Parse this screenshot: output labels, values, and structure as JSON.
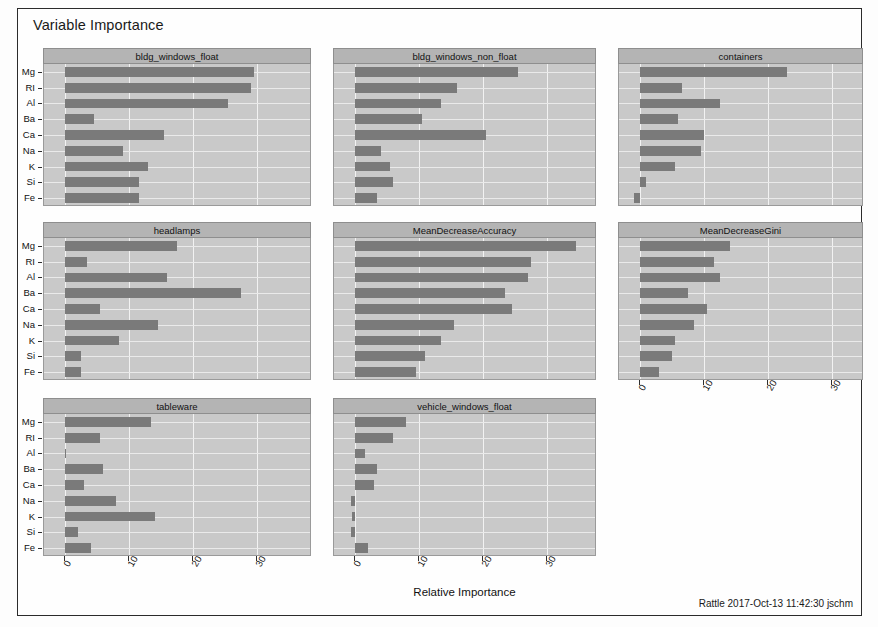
{
  "window": {
    "title": "Variable Importance"
  },
  "footer": {
    "stamp": "Rattle 2017-Oct-13 11:42:30 jschm"
  },
  "chart_data": {
    "type": "bar",
    "title": "Variable Importance",
    "orientation": "horizontal",
    "xlabel": "Relative Importance",
    "ylabel": "",
    "grid": true,
    "legend": false,
    "xlim": [
      -2,
      38
    ],
    "xticks": [
      0,
      10,
      20,
      30
    ],
    "xtick_labels": [
      "0",
      "10",
      "20",
      "30"
    ],
    "categories": [
      "Mg",
      "RI",
      "Al",
      "Ba",
      "Ca",
      "Na",
      "K",
      "Si",
      "Fe"
    ],
    "facet_layout": {
      "rows": 3,
      "cols": 3
    },
    "panels": [
      {
        "name": "bldg_windows_float",
        "values": [
          29.5,
          29.0,
          25.5,
          4.5,
          15.5,
          9.0,
          13.0,
          11.5,
          11.5
        ]
      },
      {
        "name": "bldg_windows_non_float",
        "values": [
          25.5,
          16.0,
          13.5,
          10.5,
          20.5,
          4.0,
          5.5,
          6.0,
          3.5
        ]
      },
      {
        "name": "containers",
        "values": [
          23.0,
          6.5,
          12.5,
          6.0,
          10.0,
          9.5,
          5.5,
          1.0,
          -0.9
        ]
      },
      {
        "name": "headlamps",
        "values": [
          17.5,
          3.5,
          16.0,
          27.5,
          5.5,
          14.5,
          8.5,
          2.5,
          2.5
        ]
      },
      {
        "name": "MeanDecreaseAccuracy",
        "values": [
          34.5,
          27.5,
          27.0,
          23.5,
          24.5,
          15.5,
          13.5,
          11.0,
          9.5
        ]
      },
      {
        "name": "MeanDecreaseGini",
        "values": [
          14.0,
          11.5,
          12.5,
          7.5,
          10.5,
          8.5,
          5.5,
          5.0,
          3.0
        ]
      },
      {
        "name": "tableware",
        "values": [
          13.5,
          5.5,
          0.1,
          6.0,
          3.0,
          8.0,
          14.0,
          2.0,
          4.0
        ]
      },
      {
        "name": "vehicle_windows_float",
        "values": [
          8.0,
          6.0,
          1.5,
          3.5,
          3.0,
          -0.6,
          -0.4,
          -0.7,
          2.0
        ]
      }
    ]
  }
}
